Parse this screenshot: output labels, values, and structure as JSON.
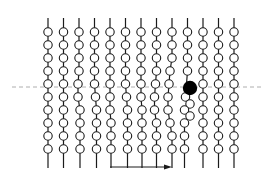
{
  "diagram": {
    "type": "bead-chain-lattice",
    "width": 269,
    "height": 179,
    "colors": {
      "background": "#ffffff",
      "stroke": "#1a1a1a",
      "bead_fill": "#ffffff",
      "highlight_fill": "#000000",
      "dashed_line": "#9a9a9a",
      "arrow": "#1a1a1a"
    },
    "chains": {
      "count": 13,
      "x_start": 48,
      "x_spacing": 15.5,
      "top_y": 18,
      "bottom_y": 168,
      "bead_radius": 4.2,
      "rows_y": [
        32,
        45,
        58,
        71,
        84,
        97,
        110,
        123,
        136,
        149
      ],
      "offsets": [
        [
          0,
          0,
          0,
          0,
          0,
          0,
          0,
          0,
          0,
          0
        ],
        [
          0,
          0,
          0,
          0,
          0,
          0,
          0,
          0,
          0,
          0
        ],
        [
          0,
          0,
          0,
          0,
          -1,
          -1,
          1,
          1,
          1,
          1
        ],
        [
          0,
          0,
          0,
          0,
          0,
          1,
          2,
          2,
          2,
          2
        ],
        [
          0,
          0,
          0,
          0,
          0,
          0,
          0,
          1,
          1,
          1
        ],
        [
          0,
          0,
          0,
          0,
          0,
          1,
          2,
          2,
          2,
          2
        ],
        [
          0,
          0,
          0,
          0,
          0,
          0,
          1,
          1,
          1,
          1
        ],
        [
          0,
          0,
          0,
          0,
          -1,
          -2,
          -2,
          0,
          0,
          0
        ],
        [
          0,
          0,
          0,
          -2,
          -3,
          -4,
          -4,
          -2,
          0,
          0
        ],
        [
          0,
          0,
          0,
          0,
          0,
          -2,
          -3,
          -3,
          -3,
          -3
        ],
        [
          0,
          0,
          0,
          0,
          0,
          0,
          0,
          0,
          0,
          0
        ],
        [
          0,
          0,
          0,
          0,
          0,
          0,
          0,
          0,
          0,
          0
        ],
        [
          0,
          0,
          0,
          0,
          0,
          0,
          0,
          0,
          0,
          0
        ]
      ],
      "extra_beads": [
        {
          "chain": 9,
          "x": 190,
          "y": 104
        },
        {
          "chain": 9,
          "x": 190,
          "y": 116
        }
      ]
    },
    "highlight_bead": {
      "x": 190,
      "y": 88,
      "radius": 7.2
    },
    "dashed_line": {
      "x1": 12,
      "x2": 262,
      "y": 87
    },
    "arrow": {
      "x1": 110,
      "x2": 172,
      "y": 167,
      "direction": "right"
    }
  }
}
